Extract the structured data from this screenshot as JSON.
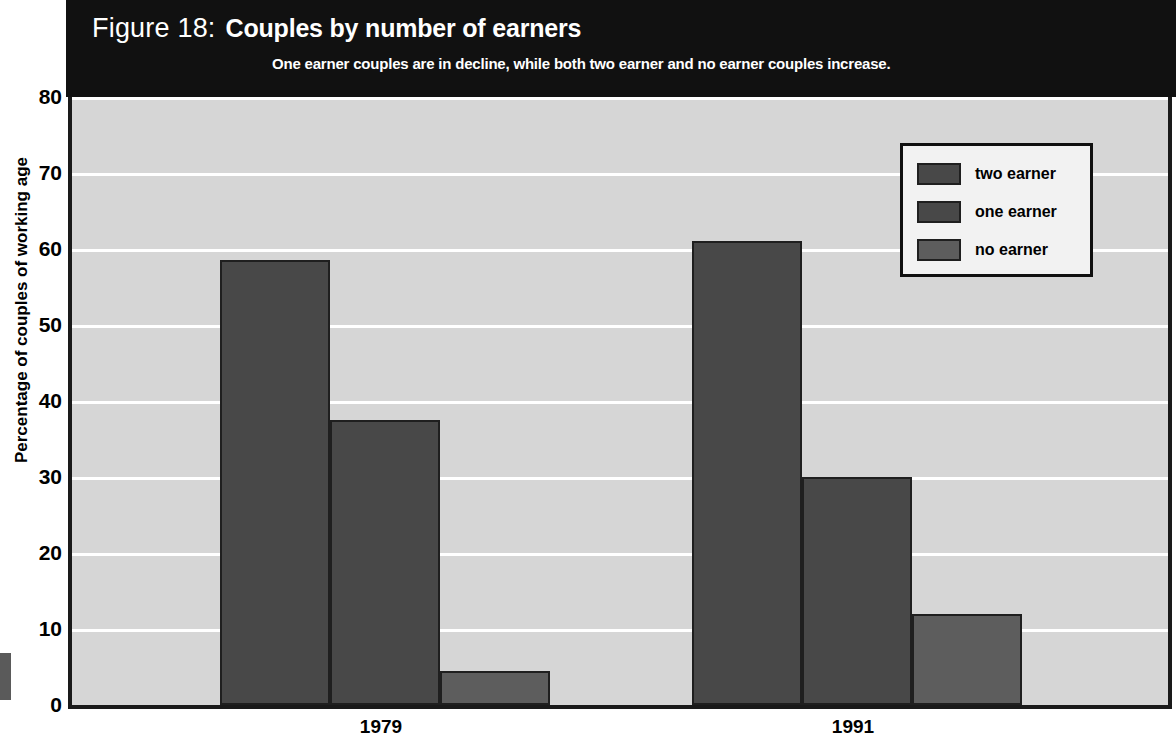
{
  "figure": {
    "label": "Figure 18:",
    "title": "Couples by number of earners",
    "subtitle": "One earner couples are in decline, while both two earner and no earner couples increase."
  },
  "legend": {
    "items": [
      {
        "label": "two earner",
        "color": "#484848"
      },
      {
        "label": "one earner",
        "color": "#484848"
      },
      {
        "label": "no earner",
        "color": "#5d5d5d"
      }
    ]
  },
  "axes": {
    "ylabel": "Percentage of couples of working age",
    "yticks": [
      "0",
      "10",
      "20",
      "30",
      "40",
      "50",
      "60",
      "70",
      "80"
    ],
    "xticks": [
      "1979",
      "1991"
    ]
  },
  "colors": {
    "title_band": "#111111",
    "plot_background": "#d6d6d6",
    "gridline": "#ffffff",
    "axis": "#1a1a1a",
    "bar_dark": "#484848",
    "bar_light": "#5d5d5d"
  },
  "chart_data": {
    "type": "bar",
    "subtitle": "One earner couples are in decline, while both two earner and no earner couples increase.",
    "xlabel": "",
    "ylabel": "Percentage of couples of working age",
    "categories": [
      "1979",
      "1991"
    ],
    "series": [
      {
        "name": "two earner",
        "values": [
          58.5,
          61.0
        ],
        "color": "#484848"
      },
      {
        "name": "one earner",
        "values": [
          37.5,
          30.0
        ],
        "color": "#484848"
      },
      {
        "name": "no earner",
        "values": [
          4.5,
          12.0
        ],
        "color": "#5d5d5d"
      }
    ],
    "ylim": [
      0,
      80
    ],
    "ytick_step": 10,
    "grid": true,
    "legend_position": "top-right"
  }
}
